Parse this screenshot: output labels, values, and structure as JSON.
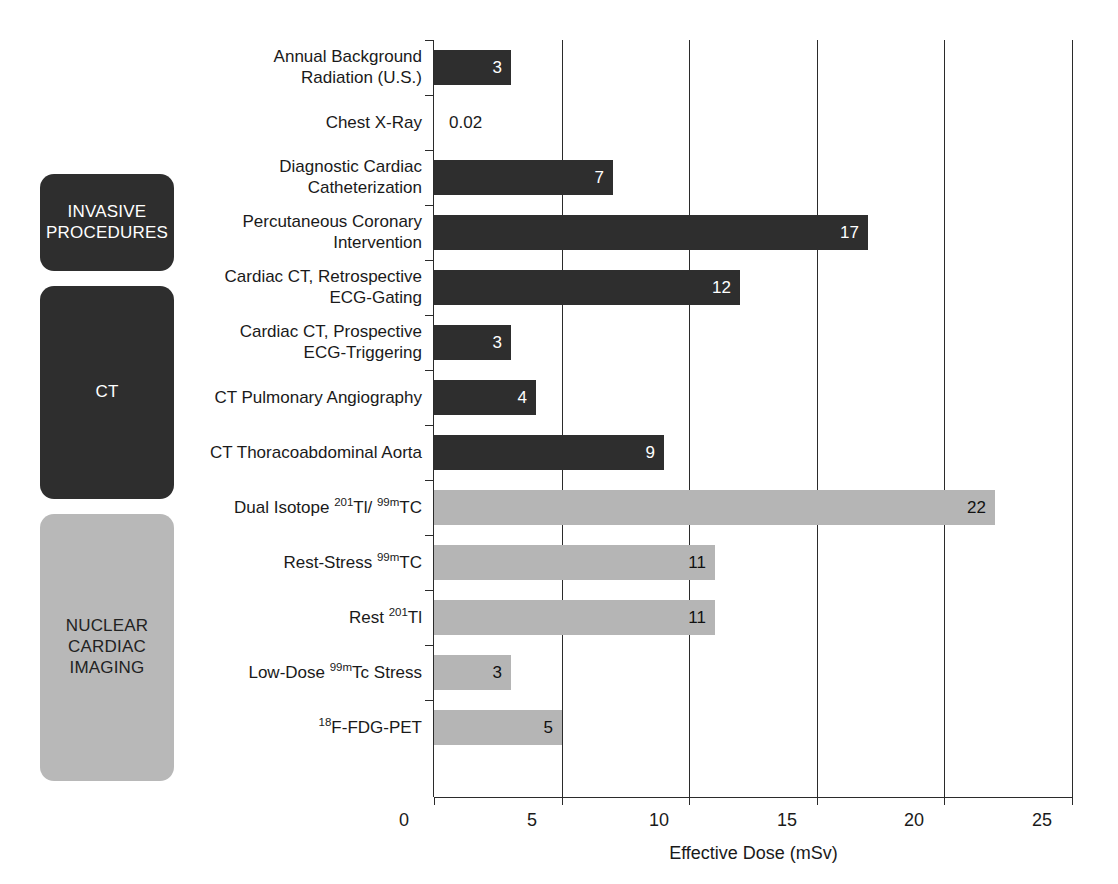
{
  "chart_data": {
    "type": "bar",
    "orientation": "horizontal",
    "title": "",
    "xlabel": "Effective Dose (mSv)",
    "ylabel": "",
    "xlim": [
      0,
      25
    ],
    "xticks": [
      0,
      5,
      10,
      15,
      20,
      25
    ],
    "grid": "vertical",
    "legend": "none",
    "categories": [
      "Annual Background\nRadiation (U.S.)",
      "Chest X-Ray",
      "Diagnostic Cardiac\nCatheterization",
      "Percutaneous Coronary\nIntervention",
      "Cardiac CT, Retrospective\nECG-Gating",
      "Cardiac CT, Prospective\nECG-Triggering",
      "CT Pulmonary Angiography",
      "CT Thoracoabdominal Aorta",
      "Dual Isotope 201Tl/ 99mTC",
      "Rest-Stress 99mTC",
      "Rest 201Tl",
      "Low-Dose 99mTc Stress",
      "18F-FDG-PET"
    ],
    "values": [
      3,
      0.02,
      7,
      17,
      12,
      3,
      4,
      9,
      22,
      11,
      11,
      3,
      5
    ],
    "value_labels": [
      "3",
      "0.02",
      "7",
      "17",
      "12",
      "3",
      "4",
      "9",
      "22",
      "11",
      "11",
      "3",
      "5"
    ]
  },
  "rows": [
    {
      "label_html": "Annual Background<br>Radiation (U.S.)",
      "value": 3,
      "value_label": "3",
      "series": "reference",
      "style": "dark",
      "label_position": "inside"
    },
    {
      "label_html": "Chest X-Ray",
      "value": 0.02,
      "value_label": "0.02",
      "series": "reference",
      "style": "dark",
      "label_position": "outside"
    },
    {
      "label_html": "Diagnostic Cardiac<br>Catheterization",
      "value": 7,
      "value_label": "7",
      "series": "invasive",
      "style": "dark",
      "label_position": "inside"
    },
    {
      "label_html": "Percutaneous Coronary<br>Intervention",
      "value": 17,
      "value_label": "17",
      "series": "invasive",
      "style": "dark",
      "label_position": "inside"
    },
    {
      "label_html": "Cardiac CT, Retrospective<br>ECG-Gating",
      "value": 12,
      "value_label": "12",
      "series": "ct",
      "style": "dark",
      "label_position": "inside"
    },
    {
      "label_html": "Cardiac CT, Prospective<br>ECG-Triggering",
      "value": 3,
      "value_label": "3",
      "series": "ct",
      "style": "dark",
      "label_position": "inside"
    },
    {
      "label_html": "CT Pulmonary Angiography",
      "value": 4,
      "value_label": "4",
      "series": "ct",
      "style": "dark",
      "label_position": "inside"
    },
    {
      "label_html": "CT Thoracoabdominal Aorta",
      "value": 9,
      "value_label": "9",
      "series": "ct",
      "style": "dark",
      "label_position": "inside"
    },
    {
      "label_html": "Dual Isotope <sup>201</sup>Tl/ <sup>99m</sup>TC",
      "value": 22,
      "value_label": "22",
      "series": "nuclear",
      "style": "light",
      "label_position": "inside"
    },
    {
      "label_html": "Rest-Stress <sup>99m</sup>TC",
      "value": 11,
      "value_label": "11",
      "series": "nuclear",
      "style": "light",
      "label_position": "inside"
    },
    {
      "label_html": "Rest <sup>201</sup>Tl",
      "value": 11,
      "value_label": "11",
      "series": "nuclear",
      "style": "light",
      "label_position": "inside"
    },
    {
      "label_html": "Low-Dose <sup>99m</sup>Tc Stress",
      "value": 3,
      "value_label": "3",
      "series": "nuclear",
      "style": "light",
      "label_position": "inside"
    },
    {
      "label_html": "<sup>18</sup>F-FDG-PET",
      "value": 5,
      "value_label": "5",
      "series": "nuclear",
      "style": "light",
      "label_position": "inside"
    }
  ],
  "groups": [
    {
      "name": "invasive-procedures",
      "label": "INVASIVE\nPROCEDURES",
      "style": "dark",
      "x": 40,
      "y": 174,
      "width": 134,
      "height": 97
    },
    {
      "name": "ct",
      "label": "CT",
      "style": "dark",
      "x": 40,
      "y": 286,
      "width": 134,
      "height": 213
    },
    {
      "name": "nuclear-cardiac-imaging",
      "label": "NUCLEAR\nCARDIAC\nIMAGING",
      "style": "light",
      "x": 40,
      "y": 514,
      "width": 134,
      "height": 267
    }
  ],
  "axis": {
    "title": "Effective Dose (mSv)",
    "ticks": [
      "0",
      "5",
      "10",
      "15",
      "20",
      "25"
    ],
    "tick_values": [
      0,
      5,
      10,
      15,
      20,
      25
    ],
    "max": 25
  },
  "colors": {
    "dark_bar": "#2e2e2e",
    "light_bar": "#b5b5b5",
    "group_light": "#b8b8b8",
    "axis": "#2b2b2b",
    "background": "#ffffff",
    "text": "#1a1a1a"
  },
  "layout": {
    "plot_left": 434,
    "plot_top": 40,
    "plot_width": 638,
    "row_height": 55,
    "bar_height": 35,
    "bar_top_offset": 10
  }
}
